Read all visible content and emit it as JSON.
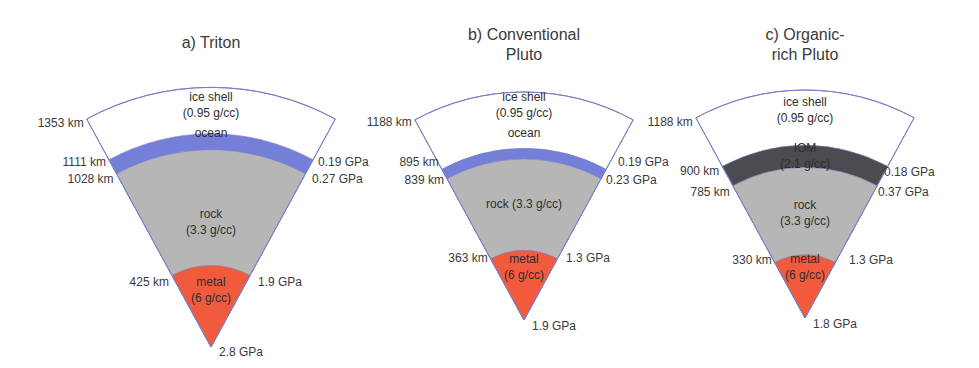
{
  "figure": {
    "colors": {
      "ice": "#ffffff",
      "ocean": "#7480d8",
      "iom": "#4b4b50",
      "rock": "#b6b6b6",
      "metal": "#f25a3e",
      "outline": "#7a80c8"
    },
    "panels": [
      {
        "id": "triton",
        "title_lines": [
          "a) Triton"
        ],
        "outer_radius_km": 1353,
        "layers": [
          {
            "name": "ice shell",
            "type": "ice",
            "label_lines": [
              "ice shell",
              "(0.95 g/cc)"
            ],
            "outer_km": 1353
          },
          {
            "name": "ocean",
            "type": "ocean",
            "label_lines": [
              "ocean"
            ],
            "outer_km": 1111
          },
          {
            "name": "rock",
            "type": "rock",
            "label_lines": [
              "rock",
              "(3.3 g/cc)"
            ],
            "outer_km": 1028
          },
          {
            "name": "metal",
            "type": "metal",
            "label_lines": [
              "metal",
              "(6 g/cc)"
            ],
            "outer_km": 425
          }
        ],
        "radius_labels": [
          "1353 km",
          "1111 km",
          "1028 km",
          "425 km"
        ],
        "pressure_labels": [
          "0.19 GPa",
          "0.27 GPa",
          "1.9 GPa",
          "2.8 GPa"
        ]
      },
      {
        "id": "conventional-pluto",
        "title_lines": [
          "b) Conventional",
          "Pluto"
        ],
        "outer_radius_km": 1188,
        "layers": [
          {
            "name": "ice shell",
            "type": "ice",
            "label_lines": [
              "ice shell",
              "(0.95 g/cc)"
            ],
            "outer_km": 1188
          },
          {
            "name": "ocean",
            "type": "ocean",
            "label_lines": [
              "ocean"
            ],
            "outer_km": 895
          },
          {
            "name": "rock",
            "type": "rock",
            "label_lines": [
              "rock (3.3 g/cc)"
            ],
            "outer_km": 839
          },
          {
            "name": "metal",
            "type": "metal",
            "label_lines": [
              "metal",
              "(6 g/cc)"
            ],
            "outer_km": 363
          }
        ],
        "radius_labels": [
          "1188 km",
          "895 km",
          "839 km",
          "363 km"
        ],
        "pressure_labels": [
          "0.19 GPa",
          "0.23 GPa",
          "1.3 GPa",
          "1.9 GPa"
        ]
      },
      {
        "id": "organic-rich-pluto",
        "title_lines": [
          "c) Organic-",
          "rich Pluto"
        ],
        "outer_radius_km": 1188,
        "layers": [
          {
            "name": "ice shell",
            "type": "ice",
            "label_lines": [
              "ice shell",
              "(0.95 g/cc)"
            ],
            "outer_km": 1188
          },
          {
            "name": "IOM",
            "type": "iom",
            "label_lines": [
              "IOM",
              "(2.1 g/cc)"
            ],
            "outer_km": 900
          },
          {
            "name": "rock",
            "type": "rock",
            "label_lines": [
              "rock",
              "(3.3 g/cc)"
            ],
            "outer_km": 785
          },
          {
            "name": "metal",
            "type": "metal",
            "label_lines": [
              "metal",
              "(6 g/cc)"
            ],
            "outer_km": 330
          }
        ],
        "radius_labels": [
          "1188 km",
          "900 km",
          "785 km",
          "330 km"
        ],
        "pressure_labels": [
          "0.18 GPa",
          "0.37 GPa",
          "1.3 GPa",
          "1.8 GPa"
        ]
      }
    ]
  }
}
